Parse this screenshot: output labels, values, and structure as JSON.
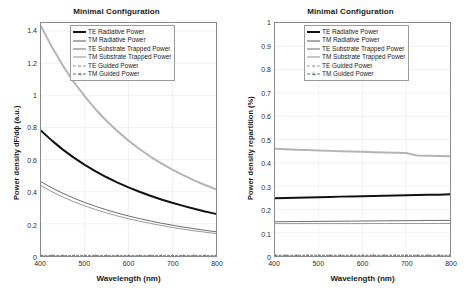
{
  "figure": {
    "background": "#ffffff",
    "panel_count": 2
  },
  "series_styles": {
    "te_radiative": {
      "color": "#121212",
      "width": 2.0,
      "dash": "none",
      "marker": "none"
    },
    "tm_radiative": {
      "color": "#5a5a5a",
      "width": 0.9,
      "dash": "none",
      "marker": "none"
    },
    "te_substrate": {
      "color": "#b4b4b4",
      "width": 2.0,
      "dash": "none",
      "marker": "none"
    },
    "tm_substrate": {
      "color": "#8e8e8e",
      "width": 0.9,
      "dash": "none",
      "marker": "none"
    },
    "te_guided": {
      "color": "#9a9a9a",
      "width": 0.8,
      "dash": "2,2",
      "marker": "circle"
    },
    "tm_guided": {
      "color": "#6e6e6e",
      "width": 0.8,
      "dash": "2,2",
      "marker": "plus"
    }
  },
  "legend": {
    "items": [
      {
        "key": "te_radiative",
        "label": "TE Radiative Power"
      },
      {
        "key": "tm_radiative",
        "label": "TM Radiative Power"
      },
      {
        "key": "te_substrate",
        "label": "TE Substrate Trapped Power"
      },
      {
        "key": "tm_substrate",
        "label": "TM Substrate Trapped Power"
      },
      {
        "key": "te_guided",
        "label": "TE Guided Power"
      },
      {
        "key": "tm_guided",
        "label": "TM Guided Power"
      }
    ]
  },
  "chart_data": [
    {
      "id": "left",
      "type": "line",
      "title": "Minimal Configuration",
      "xlabel": "Wavelength (nm)",
      "ylabel": "Power density dF/dϕ (a.u.)",
      "xlim": [
        400,
        800
      ],
      "ylim": [
        0,
        1.45
      ],
      "xticks": [
        400,
        500,
        600,
        700,
        800
      ],
      "yticks": [
        0,
        0.2,
        0.4,
        0.6,
        0.8,
        1,
        1.2,
        1.4
      ],
      "ytick_labels": [
        "0",
        "0.2",
        "0.4",
        "0.6",
        "0.8",
        "1",
        "1.2",
        "1.4"
      ],
      "xtick_labels": [
        "400",
        "500",
        "600",
        "700",
        "800"
      ],
      "grid": true,
      "legend_position": "upper right",
      "x": [
        400,
        425,
        450,
        475,
        500,
        525,
        550,
        575,
        600,
        625,
        650,
        675,
        700,
        725,
        750,
        775,
        800
      ],
      "series": [
        {
          "name": "TE Radiative Power",
          "key": "te_radiative",
          "values": [
            0.78,
            0.718,
            0.662,
            0.612,
            0.567,
            0.527,
            0.49,
            0.457,
            0.427,
            0.4,
            0.375,
            0.352,
            0.331,
            0.312,
            0.294,
            0.277,
            0.262
          ]
        },
        {
          "name": "TM Radiative Power",
          "key": "tm_radiative",
          "values": [
            0.462,
            0.424,
            0.39,
            0.36,
            0.333,
            0.309,
            0.287,
            0.267,
            0.249,
            0.233,
            0.218,
            0.204,
            0.192,
            0.18,
            0.17,
            0.16,
            0.151
          ]
        },
        {
          "name": "TE Substrate Trapped Power",
          "key": "te_substrate",
          "values": [
            1.43,
            1.3,
            1.185,
            1.083,
            0.993,
            0.912,
            0.84,
            0.776,
            0.718,
            0.666,
            0.619,
            0.577,
            0.538,
            0.503,
            0.471,
            0.442,
            0.415
          ]
        },
        {
          "name": "TM Substrate Trapped Power",
          "key": "tm_substrate",
          "values": [
            0.438,
            0.4,
            0.367,
            0.338,
            0.312,
            0.289,
            0.268,
            0.249,
            0.232,
            0.217,
            0.203,
            0.19,
            0.178,
            0.167,
            0.157,
            0.148,
            0.14
          ]
        },
        {
          "name": "TE Guided Power",
          "key": "te_guided",
          "values": [
            0.004,
            0.004,
            0.004,
            0.004,
            0.004,
            0.004,
            0.004,
            0.004,
            0.004,
            0.004,
            0.004,
            0.004,
            0.004,
            0.004,
            0.004,
            0.004,
            0.004
          ]
        },
        {
          "name": "TM Guided Power",
          "key": "tm_guided",
          "values": [
            0.002,
            0.002,
            0.002,
            0.002,
            0.002,
            0.002,
            0.002,
            0.002,
            0.002,
            0.002,
            0.002,
            0.002,
            0.002,
            0.002,
            0.002,
            0.002,
            0.002
          ]
        }
      ]
    },
    {
      "id": "right",
      "type": "line",
      "title": "Minimal Configuration",
      "xlabel": "Wavelength (nm)",
      "ylabel": "Power density repartition (%)",
      "xlim": [
        400,
        800
      ],
      "ylim": [
        0,
        1
      ],
      "xticks": [
        400,
        500,
        600,
        700,
        800
      ],
      "yticks": [
        0,
        0.1,
        0.2,
        0.3,
        0.4,
        0.5,
        0.6,
        0.7,
        0.8,
        0.9,
        1
      ],
      "ytick_labels": [
        "0",
        "0.1",
        "0.2",
        "0.3",
        "0.4",
        "0.5",
        "0.6",
        "0.7",
        "0.8",
        "0.9",
        "1"
      ],
      "xtick_labels": [
        "400",
        "500",
        "600",
        "700",
        "800"
      ],
      "grid": true,
      "legend_position": "upper right",
      "x": [
        400,
        425,
        450,
        475,
        500,
        525,
        550,
        575,
        600,
        625,
        650,
        675,
        700,
        725,
        750,
        775,
        800
      ],
      "series": [
        {
          "name": "TE Radiative Power",
          "key": "te_radiative",
          "values": [
            0.248,
            0.2492,
            0.2504,
            0.2515,
            0.2526,
            0.2537,
            0.2548,
            0.2558,
            0.2568,
            0.2578,
            0.2588,
            0.2597,
            0.2606,
            0.2615,
            0.2624,
            0.2633,
            0.265
          ]
        },
        {
          "name": "TM Radiative Power",
          "key": "tm_radiative",
          "values": [
            0.147,
            0.1474,
            0.1478,
            0.1482,
            0.1486,
            0.149,
            0.1494,
            0.1498,
            0.1502,
            0.1506,
            0.151,
            0.1513,
            0.1517,
            0.152,
            0.1524,
            0.1527,
            0.153
          ]
        },
        {
          "name": "TE Substrate Trapped Power",
          "key": "te_substrate",
          "values": [
            0.46,
            0.458,
            0.4562,
            0.4545,
            0.4528,
            0.4512,
            0.4497,
            0.4483,
            0.447,
            0.4457,
            0.4445,
            0.4433,
            0.4422,
            0.4311,
            0.43,
            0.429,
            0.428
          ]
        },
        {
          "name": "TM Substrate Trapped Power",
          "key": "tm_substrate",
          "values": [
            0.139,
            0.139,
            0.139,
            0.1391,
            0.1391,
            0.1391,
            0.1392,
            0.1392,
            0.1392,
            0.1393,
            0.1393,
            0.1393,
            0.1394,
            0.1394,
            0.1394,
            0.1395,
            0.1395
          ]
        },
        {
          "name": "TE Guided Power",
          "key": "te_guided",
          "values": [
            0.004,
            0.004,
            0.004,
            0.004,
            0.004,
            0.004,
            0.004,
            0.004,
            0.004,
            0.004,
            0.004,
            0.004,
            0.004,
            0.004,
            0.004,
            0.004,
            0.004
          ]
        },
        {
          "name": "TM Guided Power",
          "key": "tm_guided",
          "values": [
            0.002,
            0.002,
            0.002,
            0.002,
            0.002,
            0.002,
            0.002,
            0.002,
            0.002,
            0.002,
            0.002,
            0.002,
            0.002,
            0.002,
            0.002,
            0.002,
            0.002
          ]
        }
      ]
    }
  ]
}
